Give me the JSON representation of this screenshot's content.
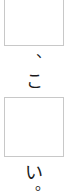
{
  "worksheet": {
    "orientation": "vertical",
    "sequence": [
      {
        "type": "blank",
        "value": ""
      },
      {
        "type": "text",
        "value": "、"
      },
      {
        "type": "text",
        "value": "こ"
      },
      {
        "type": "blank",
        "value": ""
      },
      {
        "type": "text",
        "value": "い"
      },
      {
        "type": "text",
        "value": "。"
      }
    ],
    "blank_1": "",
    "comma": "、",
    "kana_ko": "こ",
    "blank_2": "",
    "kana_i": "い",
    "period": "。"
  },
  "colors": {
    "background": "#ffffff",
    "box_border": "#c8c8c8",
    "text": "#1a1a1a"
  }
}
